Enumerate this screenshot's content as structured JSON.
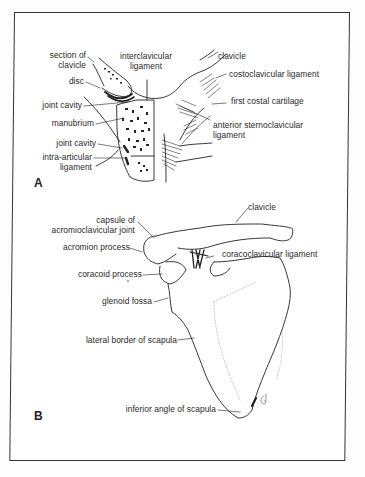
{
  "figure": {
    "panel_a": {
      "letter": "A",
      "labels": {
        "section_of_clavicle_1": "section of",
        "section_of_clavicle_2": "clavicle",
        "disc": "disc",
        "joint_cavity_upper": "joint cavity",
        "manubrium": "manubrium",
        "joint_cavity_lower": "joint cavity",
        "intra_articular_1": "intra-articular",
        "intra_articular_2": "ligament",
        "interclavicular_1": "interclavicular",
        "interclavicular_2": "ligament",
        "clavicle": "clavicle",
        "costoclavicular": "costoclavicular  ligament",
        "first_costal": "first costal cartilage",
        "anterior_sc_1": "anterior sternoclavicular",
        "anterior_sc_2": "ligament"
      }
    },
    "panel_b": {
      "letter": "B",
      "labels": {
        "clavicle": "clavicle",
        "capsule_1": "capsule of",
        "capsule_2": "acromioclavicular joint",
        "acromion": "acromion process",
        "coracoclavicular": "coracoclavicular ligament",
        "coracoid": "coracoid process",
        "glenoid": "glenoid fossa",
        "lateral_border": "lateral border of scapula",
        "inferior_angle": "inferior angle of scapula"
      }
    },
    "signature": "Gi"
  }
}
